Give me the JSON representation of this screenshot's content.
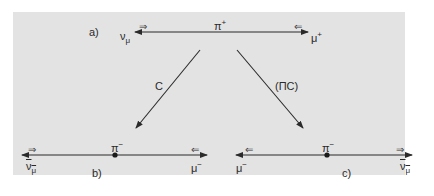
{
  "diagram": {
    "colors": {
      "panel": "#e3e3e3",
      "ink": "#2a2a2a"
    },
    "panel_a": {
      "label": "a)",
      "center_particle": {
        "base": "π",
        "charge": "+"
      },
      "left_particle": {
        "base": "ν",
        "sub": "μ",
        "bar": false,
        "spin": "⇒"
      },
      "right_particle": {
        "base": "μ",
        "charge": "+",
        "spin": "⇐"
      }
    },
    "transforms": {
      "left": {
        "label": "C"
      },
      "right": {
        "label": "(ПС)"
      }
    },
    "panel_b": {
      "label": "b)",
      "center_particle": {
        "base": "π",
        "charge": "−"
      },
      "left_particle": {
        "base": "ν",
        "sub": "μ",
        "bar": true,
        "spin": "⇒"
      },
      "right_particle": {
        "base": "μ",
        "charge": "−",
        "spin": "⇐"
      }
    },
    "panel_c": {
      "label": "c)",
      "center_particle": {
        "base": "π",
        "charge": "−"
      },
      "left_particle": {
        "base": "μ",
        "charge": "−",
        "spin": "⇐"
      },
      "right_particle": {
        "base": "ν",
        "sub": "μ",
        "bar": true,
        "spin": "⇒"
      }
    }
  }
}
